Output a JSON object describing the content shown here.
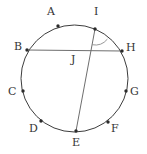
{
  "figure": {
    "type": "geometry-diagram",
    "canvas": {
      "width": 147,
      "height": 154,
      "background": "#ffffff"
    },
    "style": {
      "stroke_color": "#4a4a4a",
      "circle_stroke_color": "#3d3d3d",
      "chord_stroke_color": "#6e6e6e",
      "point_fill": "#2b2b2b",
      "label_color": "#353535",
      "stroke_width": 1,
      "point_radius": 1.7,
      "label_font_size": "11px"
    },
    "circle": {
      "cx": 74.5,
      "cy": 78.5,
      "r": 53.5,
      "label": "circle"
    },
    "points": [
      {
        "id": "A",
        "label": "A",
        "x": 58,
        "y": 26,
        "label_x": 47,
        "label_y": 6,
        "on_circle": true
      },
      {
        "id": "B",
        "label": "B",
        "x": 27,
        "y": 50,
        "label_x": 14,
        "label_y": 41,
        "on_circle": true
      },
      {
        "id": "C",
        "label": "C",
        "x": 23,
        "y": 91,
        "label_x": 8,
        "label_y": 86,
        "on_circle": true
      },
      {
        "id": "D",
        "label": "D",
        "x": 41,
        "y": 121,
        "label_x": 29,
        "label_y": 123,
        "on_circle": true
      },
      {
        "id": "E",
        "label": "E",
        "x": 76,
        "y": 131,
        "label_x": 72,
        "label_y": 137,
        "on_circle": true
      },
      {
        "id": "F",
        "label": "F",
        "x": 108,
        "y": 122,
        "label_x": 111,
        "label_y": 123,
        "on_circle": true
      },
      {
        "id": "G",
        "label": "G",
        "x": 126,
        "y": 91,
        "label_x": 130,
        "label_y": 86,
        "on_circle": true
      },
      {
        "id": "H",
        "label": "H",
        "x": 122,
        "y": 51,
        "label_x": 126,
        "label_y": 42,
        "on_circle": true
      },
      {
        "id": "I",
        "label": "I",
        "x": 95,
        "y": 29,
        "label_x": 94,
        "label_y": 6,
        "on_circle": true
      },
      {
        "id": "J",
        "label": "J",
        "x": 82,
        "y": 51,
        "label_x": 71,
        "label_y": 54,
        "on_circle": false
      }
    ],
    "segments": [
      {
        "id": "BH",
        "from": "B",
        "to": "H",
        "x1": 27,
        "y1": 50,
        "x2": 122,
        "y2": 51,
        "label": "chord-bh"
      },
      {
        "id": "IE",
        "from": "I",
        "to": "E",
        "x1": 95,
        "y1": 29,
        "x2": 76,
        "y2": 131,
        "label": "chord-ie"
      }
    ],
    "angle_marks": [
      {
        "id": "angle-at-I",
        "vertex": "I",
        "vertex_x": 95,
        "vertex_y": 29,
        "radius": 16,
        "between": [
          "IE",
          "IH"
        ],
        "label": "angle-arc-i"
      }
    ]
  },
  "labels": {
    "A": "A",
    "B": "B",
    "C": "C",
    "D": "D",
    "E": "E",
    "F": "F",
    "G": "G",
    "H": "H",
    "I": "I",
    "J": "J"
  }
}
